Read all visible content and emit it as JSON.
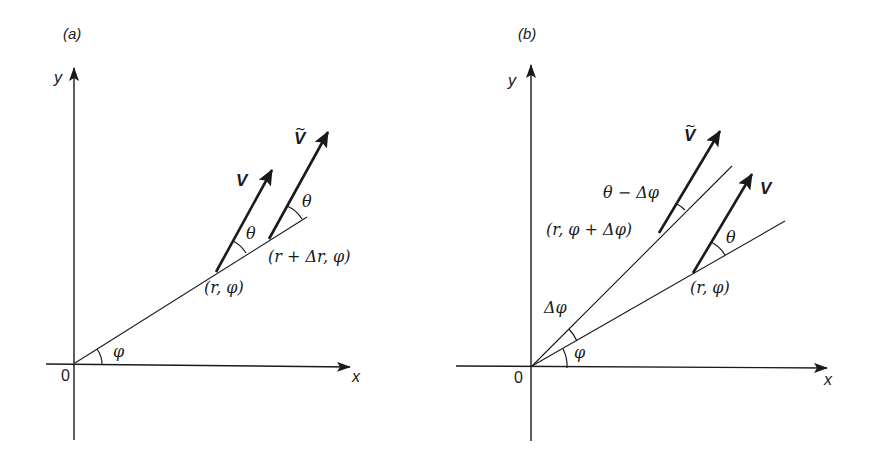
{
  "panels": [
    {
      "id": "a",
      "label": "(a)",
      "axes": {
        "x": "x",
        "y": "y",
        "origin": "0"
      },
      "angle_phi": "φ",
      "vector_v": "V",
      "vector_v_tilde": "V",
      "angle_theta_1": "θ",
      "angle_theta_2": "θ",
      "point_1": "(r, φ)",
      "point_2": "(r + Δr, φ)"
    },
    {
      "id": "b",
      "label": "(b)",
      "axes": {
        "x": "x",
        "y": "y",
        "origin": "0"
      },
      "angle_phi": "φ",
      "angle_delta_phi": "Δφ",
      "vector_v": "V",
      "vector_v_tilde": "V",
      "angle_theta": "θ",
      "angle_theta_minus": "θ − Δφ",
      "point_1": "(r, φ)",
      "point_2": "(r, φ + Δφ)"
    }
  ],
  "colors": {
    "ink": "#1a1a1a",
    "background": "#ffffff"
  }
}
